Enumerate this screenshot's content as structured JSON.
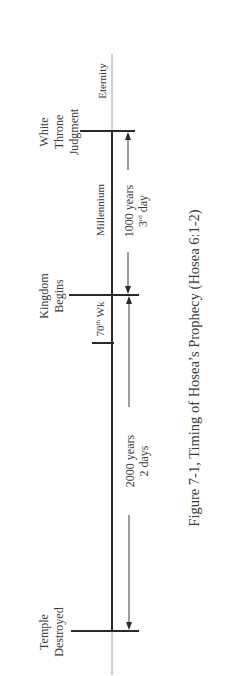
{
  "diagram": {
    "type": "timeline",
    "orientation": "vertical, text rotated 90° counter-clockwise",
    "events": [
      {
        "id": "temple",
        "label_lines": [
          "Temple",
          "Destroyed"
        ]
      },
      {
        "id": "kingdom",
        "label_lines": [
          "Kingdom",
          "Begins"
        ]
      },
      {
        "id": "white_throne",
        "label_lines": [
          "White",
          "Throne",
          "Judgment"
        ]
      }
    ],
    "period_labels": {
      "seventieth_week": {
        "base": "70",
        "sup": "th",
        "suffix": " Wk"
      },
      "millennium": "Millennium",
      "eternity": "Eternity"
    },
    "spans": {
      "first": {
        "line1": "2000 years",
        "line2": "2 days"
      },
      "second": {
        "line1": "1000 years",
        "line2_base": "3",
        "line2_sup": "rd",
        "line2_suffix": " day"
      }
    },
    "caption": "Figure 7-1, Timing of Hosea’s Prophecy (Hosea 6:1-2)",
    "colors": {
      "line": "#2a2a2a",
      "thin_line": "#9a9a9a",
      "text": "#3a3a3a"
    }
  }
}
